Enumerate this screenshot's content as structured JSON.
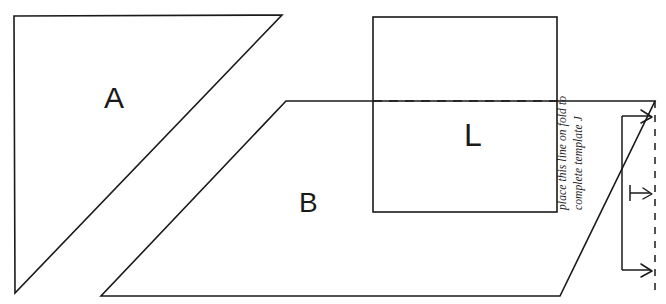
{
  "page": {
    "background_color": "#ffffff",
    "ink_color": "#1a1a1a",
    "width": 666,
    "height": 304
  },
  "labels": {
    "triangle_a": "A",
    "parallelogram_b": "B",
    "square_l": "L"
  },
  "annotation": {
    "fold_note": "place this line on fold to\ncomplete template J"
  },
  "geometry": {
    "triangle_a": {
      "name": "A",
      "type": "right-triangle",
      "points": "14,16 282,15 15,293"
    },
    "parallelogram_b": {
      "name": "B",
      "type": "parallelogram",
      "points": "286,101 655,101 560,296 101,296"
    },
    "square_l": {
      "name": "L",
      "type": "square",
      "x": 373,
      "y": 17,
      "width": 184,
      "height": 195
    },
    "fold_line": {
      "name": "fold-line",
      "type": "dashed-horizontal",
      "x1": 373,
      "x2": 557,
      "y": 101
    },
    "mirror_edge": {
      "name": "mirror-edge",
      "type": "dashed-vertical",
      "x": 655,
      "y1": 101,
      "y2": 296
    },
    "pointer_bracket": {
      "name": "pointer-bracket",
      "x": 622,
      "y_top": 116,
      "y_bottom": 270,
      "tick_y": 193
    }
  }
}
